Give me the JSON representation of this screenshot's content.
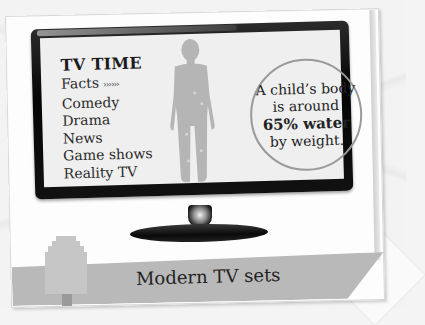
{
  "screen": {
    "menu": {
      "title": "TV TIME",
      "items": [
        {
          "label": "Facts",
          "suffix": "››››››"
        },
        {
          "label": "Comedy"
        },
        {
          "label": "Drama"
        },
        {
          "label": "News"
        },
        {
          "label": "Game shows"
        },
        {
          "label": "Reality TV"
        }
      ]
    },
    "fact": {
      "line1": "A child’s body",
      "line2": "is around",
      "highlight": "65% water",
      "line3": "by weight."
    },
    "figure_icon": "child-silhouette"
  },
  "caption": "Modern TV sets",
  "colors": {
    "bezel": "#0a0a0a",
    "screen": "#efefef",
    "silhouette": "#b5b5b5",
    "banner": "#b9b9b9",
    "circle_border": "#9a9a9a"
  }
}
